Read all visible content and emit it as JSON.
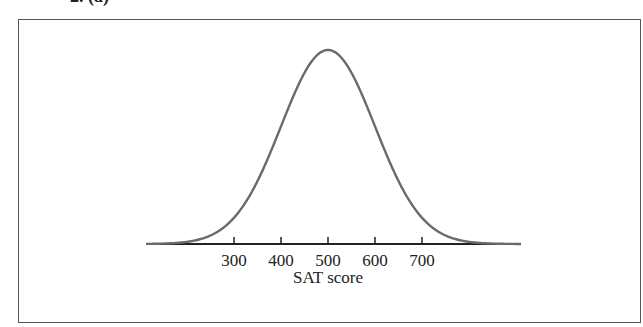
{
  "figure_label": "2. (a)",
  "chart_data": {
    "type": "line",
    "title": "",
    "subtitle": "Normal distribution of SAT scores (mean 500, SD 100)",
    "xlabel": "SAT score",
    "ylabel": "",
    "x_ticks": [
      "300",
      "400",
      "500",
      "600",
      "700"
    ],
    "distribution": {
      "kind": "normal",
      "mean": 500,
      "sd": 100
    },
    "series": [
      {
        "name": "density",
        "x": [
          100,
          200,
          300,
          400,
          500,
          600,
          700,
          800,
          900
        ],
        "values": [
          0.0001,
          0.0044,
          0.054,
          0.242,
          0.3989,
          0.242,
          0.054,
          0.0044,
          0.0001
        ]
      }
    ],
    "xlim": [
      80,
      900
    ],
    "grid": false,
    "legend": "none",
    "curve_color": "#6a6a6a",
    "axis_color": "#222222"
  }
}
